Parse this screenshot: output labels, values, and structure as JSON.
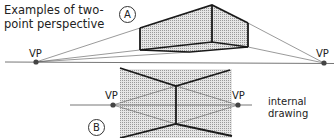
{
  "title": {
    "line1": "Examples of two-",
    "line2": "point perspective"
  },
  "drawings": {
    "a": {
      "badge": "A",
      "vp_left_label": "VP",
      "vp_right_label": "VP"
    },
    "b": {
      "badge": "B",
      "vp_left_label": "VP",
      "vp_right_label": "VP",
      "note_line1": "internal",
      "note_line2": "drawing"
    }
  },
  "colors": {
    "line": "#1a1a1a",
    "construction_line": "#555555",
    "horizon": "#777777",
    "shading": "#cfcfcf",
    "vp_dot": "#444444"
  }
}
